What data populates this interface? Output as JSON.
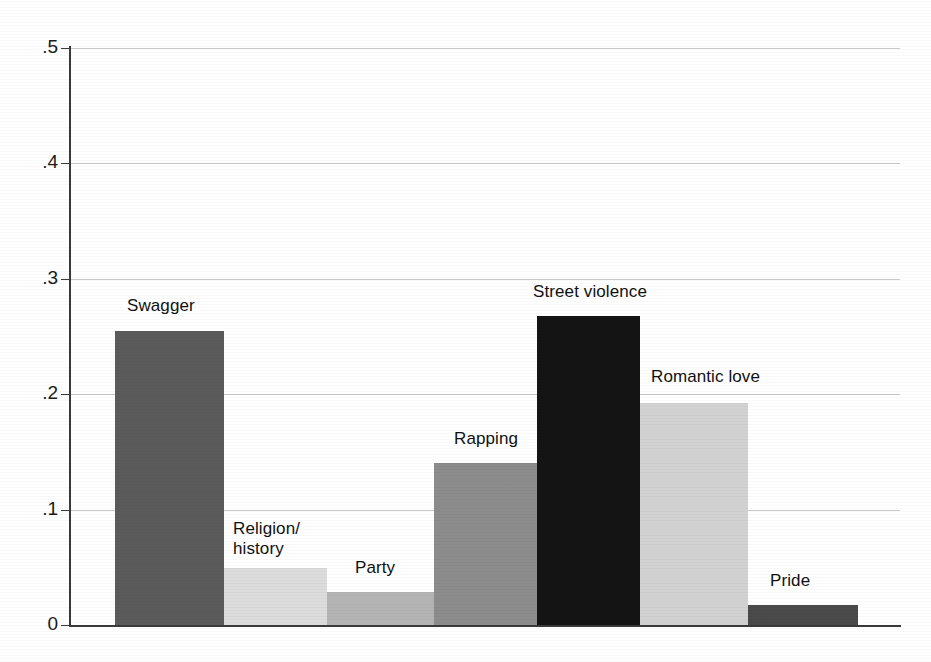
{
  "chart_data": {
    "type": "bar",
    "title": "",
    "subtitle": "",
    "xlabel": "",
    "ylabel": "",
    "ylim": [
      0,
      0.5
    ],
    "ytick_labels": [
      "0",
      ".1",
      ".2",
      ".3",
      ".4",
      ".5"
    ],
    "ytick_values": [
      0,
      0.1,
      0.2,
      0.3,
      0.4,
      0.5
    ],
    "grid": true,
    "legend": "none",
    "categories": [
      "Swagger",
      "Religion/\nhistory",
      "Party",
      "Rapping",
      "Street violence",
      "Romantic love",
      "Pride"
    ],
    "values": [
      0.255,
      0.049,
      0.029,
      0.14,
      0.268,
      0.192,
      0.017
    ],
    "bar_colors": [
      "#5b5b5b",
      "#dcdcdc",
      "#b4b4b4",
      "#8c8c8c",
      "#141414",
      "#d2d2d2",
      "#4a4a4a"
    ],
    "label_position": "above-bar",
    "axis_color": "#3a3a3a",
    "grid_color": "#c9c9c9",
    "background": "#ffffff"
  },
  "bars": [
    {
      "label": "Swagger",
      "value": 0.255,
      "color": "#5b5b5b",
      "x": 45,
      "width": 109,
      "label_x": 57,
      "label_y": 296
    },
    {
      "label": "Religion/\nhistory",
      "value": 0.049,
      "color": "#dcdcdc",
      "x": 154,
      "width": 103,
      "label_x": 163,
      "label_y": 519
    },
    {
      "label": "Party",
      "value": 0.029,
      "color": "#b4b4b4",
      "x": 257,
      "width": 107,
      "label_x": 285,
      "label_y": 558
    },
    {
      "label": "Rapping",
      "value": 0.14,
      "color": "#8c8c8c",
      "x": 364,
      "width": 103,
      "label_x": 384,
      "label_y": 429
    },
    {
      "label": "Street violence",
      "value": 0.268,
      "color": "#141414",
      "x": 467,
      "width": 103,
      "label_x": 463,
      "label_y": 282
    },
    {
      "label": "Romantic love",
      "value": 0.192,
      "color": "#d2d2d2",
      "x": 570,
      "width": 108,
      "label_x": 581,
      "label_y": 367
    },
    {
      "label": "Pride",
      "value": 0.017,
      "color": "#4a4a4a",
      "x": 678,
      "width": 110,
      "label_x": 700,
      "label_y": 571
    }
  ],
  "yticks": [
    {
      "label": ".5",
      "value": 0.5,
      "y": 48
    },
    {
      "label": ".4",
      "value": 0.4,
      "y": 163
    },
    {
      "label": ".3",
      "value": 0.3,
      "y": 279
    },
    {
      "label": ".2",
      "value": 0.2,
      "y": 394
    },
    {
      "label": ".1",
      "value": 0.1,
      "y": 510
    },
    {
      "label": "0",
      "value": 0.0,
      "y": 625
    }
  ]
}
